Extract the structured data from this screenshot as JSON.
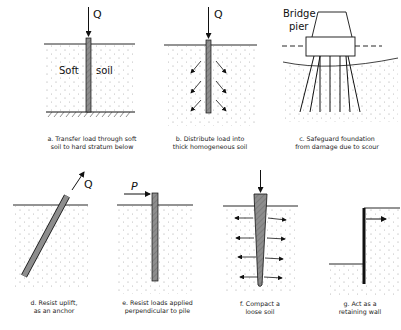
{
  "panels": [
    {
      "id": "a",
      "caption_line1": "a.  Transfer load through soft",
      "caption_line2": "soil to hard stratum below",
      "labels": {
        "load": "Q",
        "soil_left": "Soft",
        "soil_right": "soil"
      }
    },
    {
      "id": "b",
      "caption_line1": "b.  Distribute load into",
      "caption_line2": "thick homogeneous soil",
      "labels": {
        "load": "Q"
      }
    },
    {
      "id": "c",
      "caption_line1": "c.  Safeguard foundation",
      "caption_line2": "from damage due to scour",
      "labels": {
        "pier_line1": "Bridge",
        "pier_line2": "pier"
      }
    },
    {
      "id": "d",
      "caption_line1": "d.  Resist uplift,",
      "caption_line2": "as an anchor",
      "labels": {
        "load": "Q"
      }
    },
    {
      "id": "e",
      "caption_line1": "e.  Resist loads applied",
      "caption_line2": "perpendicular to pile",
      "labels": {
        "load": "P"
      }
    },
    {
      "id": "f",
      "caption_line1": "f.  Compact a",
      "caption_line2": "loose soil",
      "labels": {}
    },
    {
      "id": "g",
      "caption_line1": "g.  Act as a",
      "caption_line2": "retaining wall",
      "labels": {}
    }
  ],
  "colors": {
    "pile_fill": "#8a8a8a",
    "line": "#111111",
    "soil_dot": "#9a9a9a"
  }
}
